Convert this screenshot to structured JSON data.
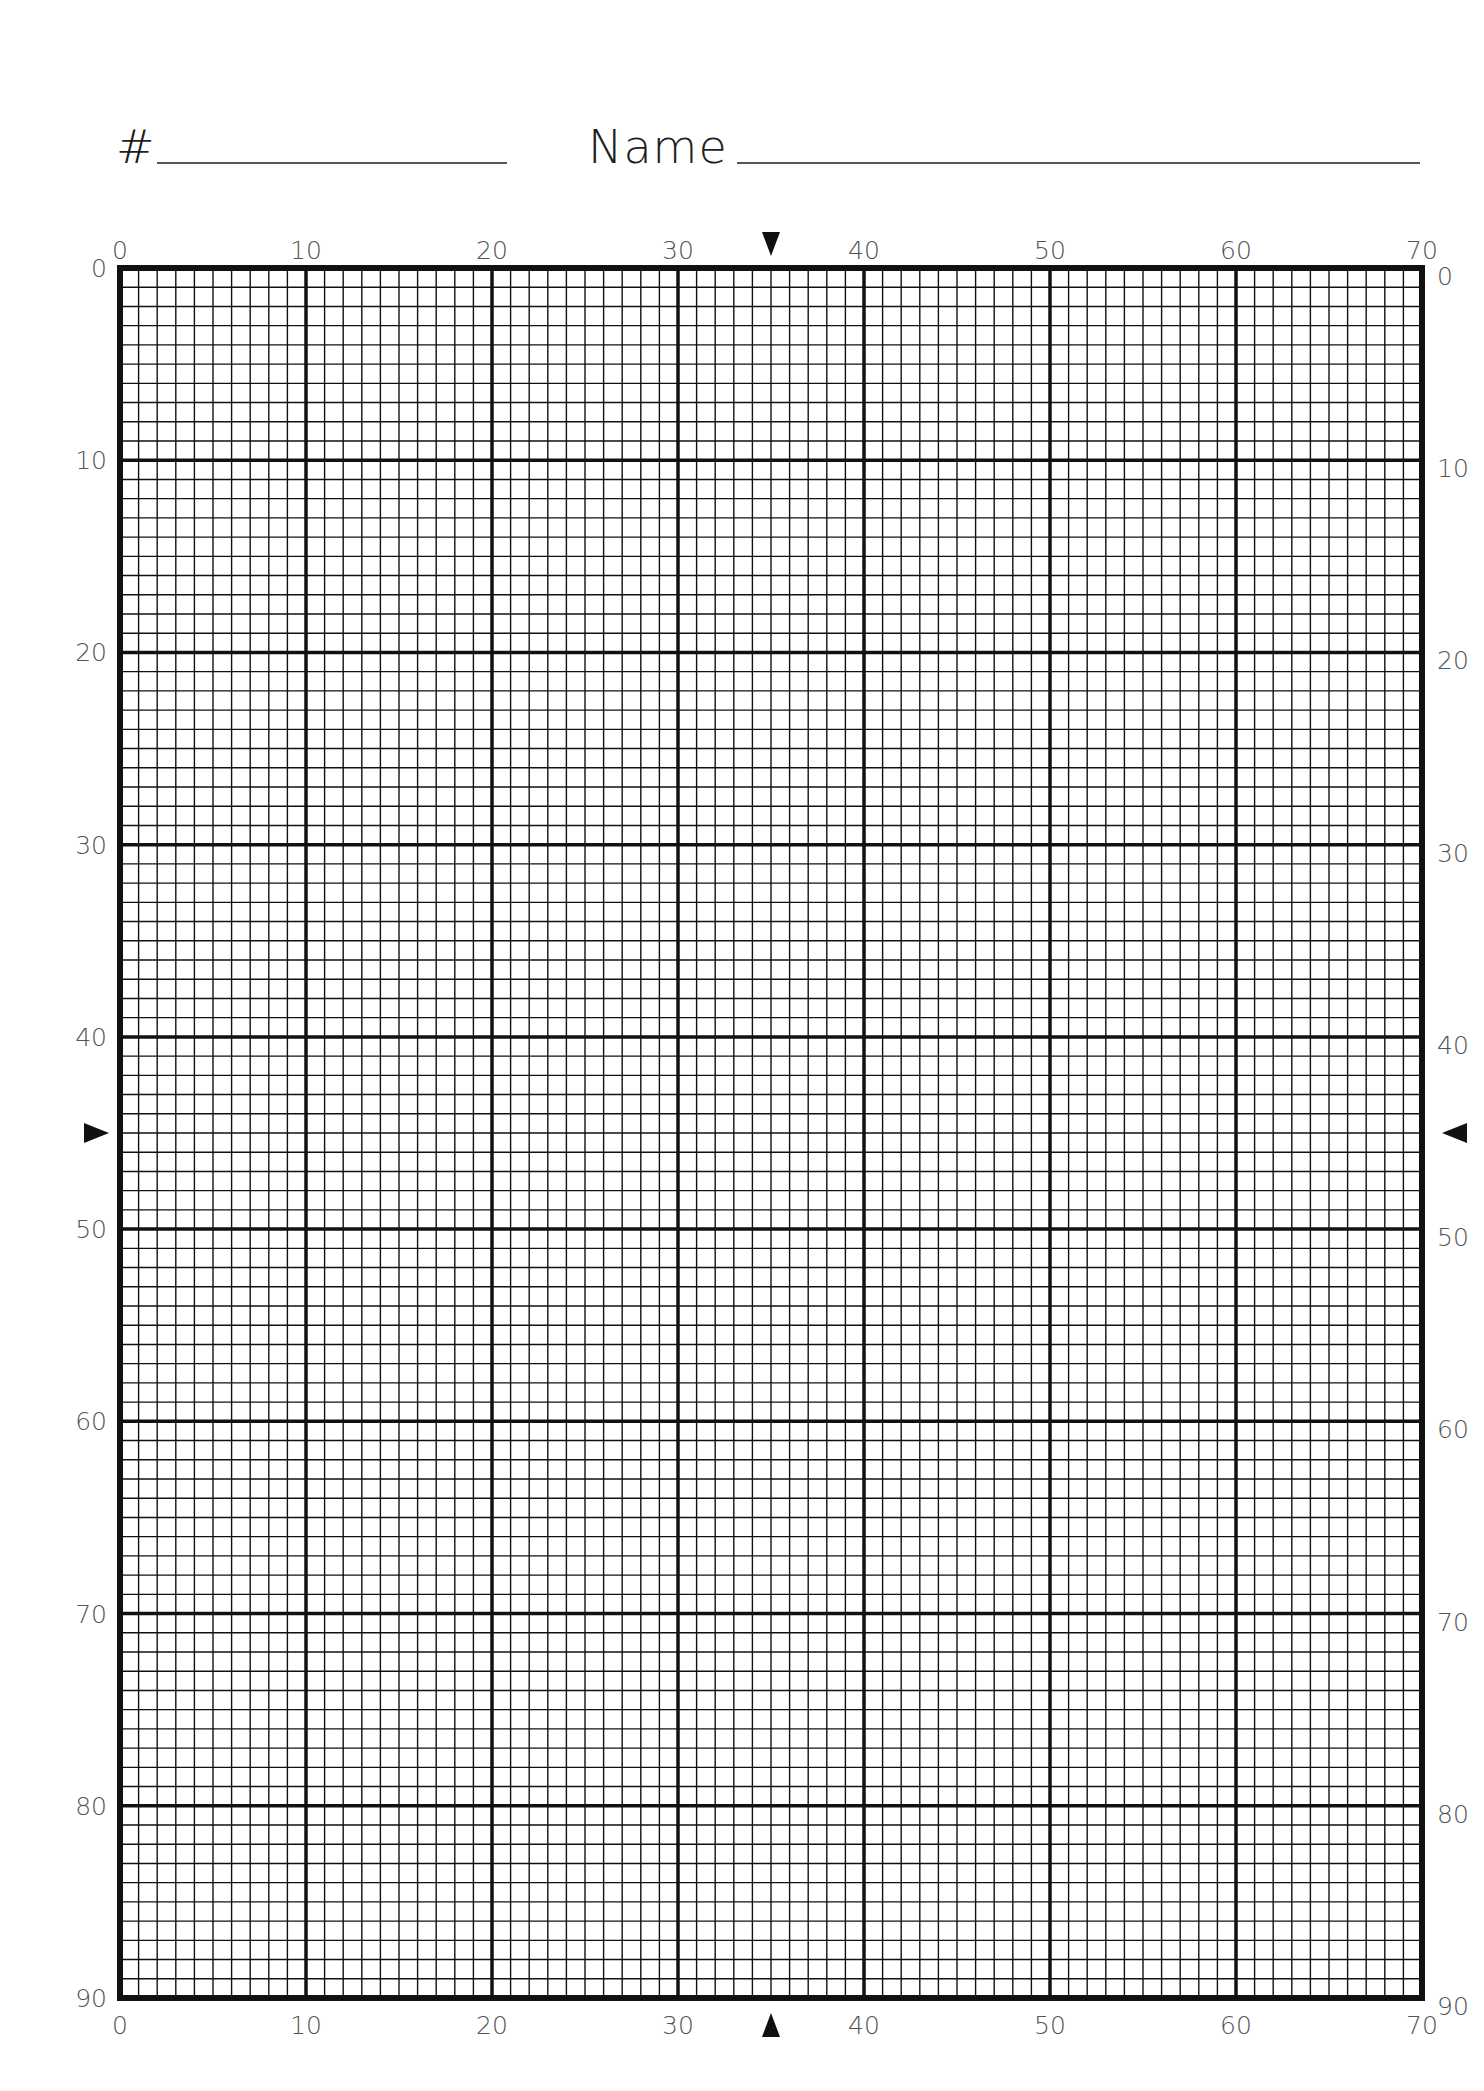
{
  "header": {
    "number_label": "#",
    "number_value": "",
    "name_label": "Name",
    "name_value": ""
  },
  "grid": {
    "columns": 70,
    "rows": 90,
    "major_every": 10,
    "left": 120,
    "top": 268,
    "right": 1422,
    "bottom": 1998,
    "line_color": "#111111",
    "minor_width": 1.4,
    "major_width": 3.5,
    "border_width": 6
  },
  "axis_labels": {
    "top": [
      "0",
      "10",
      "20",
      "30",
      "40",
      "50",
      "60",
      "70"
    ],
    "bottom": [
      "0",
      "10",
      "20",
      "30",
      "40",
      "50",
      "60",
      "70"
    ],
    "left": [
      "0",
      "10",
      "20",
      "30",
      "40",
      "50",
      "60",
      "70",
      "80",
      "90"
    ],
    "right": [
      "0",
      "10",
      "20",
      "30",
      "40",
      "50",
      "60",
      "70",
      "80",
      "90"
    ]
  },
  "center_markers": {
    "column": 35,
    "row": 45,
    "top_icon": "triangle-down-icon",
    "bottom_icon": "triangle-up-icon",
    "left_icon": "triangle-right-icon",
    "right_icon": "triangle-left-icon"
  }
}
